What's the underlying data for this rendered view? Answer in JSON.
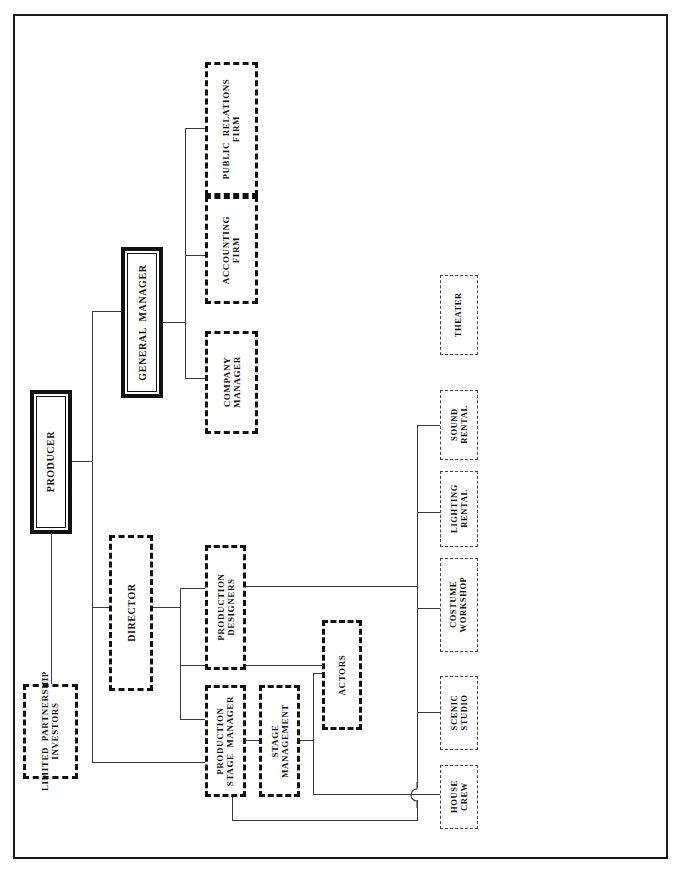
{
  "diagram": {
    "orientation": "landscape-rotated",
    "nodes": {
      "producer": "PRODUCER",
      "limited_partnership_investors": "LIMITED  PARTNERSHIP\nINVESTORS",
      "general_manager": "GENERAL  MANAGER",
      "company_manager": "COMPANY\nMANAGER",
      "accounting_firm": "ACCOUNTING\nFIRM",
      "public_relations_firm": "PUBLIC  RELATIONS\nFIRM",
      "director": "DIRECTOR",
      "production_designers": "PRODUCTION\nDESIGNERS",
      "production_stage_manager": "PRODUCTION\nSTAGE  MANAGER",
      "stage_management": "STAGE\nMANAGEMENT",
      "actors": "ACTORS",
      "house_crew": "HOUSE\nCREW",
      "scenic_studio": "SCENIC\nSTUDIO",
      "costume_workshop": "COSTUME\nWORKSHOP",
      "lighting_rental": "LIGHTING\nRENTAL",
      "sound_rental": "SOUND\nRENTAL",
      "theater": "THEATER"
    },
    "styles": {
      "primary": "thick solid double border",
      "dashed": "heavy dashed border",
      "thin": "light thin dashed border"
    },
    "colors": {
      "ink": "#111111",
      "line": "#3a3a3a",
      "thin_border": "#444444",
      "background": "#ffffff"
    }
  }
}
